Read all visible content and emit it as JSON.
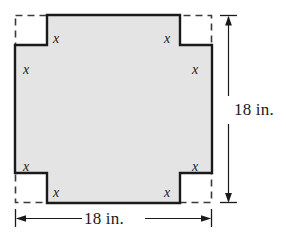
{
  "figure": {
    "shape_kind": "cross-shaped region",
    "fill_color": "#e4e4e4",
    "outline_color": "#1a1a1a",
    "dashed_color": "#3a3a3a",
    "background_color": "#ffffff",
    "outer_square": {
      "width_label": "18 in.",
      "height_label": "18 in.",
      "style": "dashed"
    },
    "dimensions": [
      {
        "id": "width",
        "label": "18 in.",
        "orientation": "horizontal"
      },
      {
        "id": "height",
        "label": "18 in.",
        "orientation": "vertical"
      }
    ],
    "corner_labels": [
      {
        "id": "top-left-horizontal",
        "text": "x",
        "x": 53,
        "y": 32
      },
      {
        "id": "top-left-vertical",
        "text": "x",
        "x": 23,
        "y": 63
      },
      {
        "id": "top-right-horizontal",
        "text": "x",
        "x": 164,
        "y": 32
      },
      {
        "id": "top-right-vertical",
        "text": "x",
        "x": 192,
        "y": 63
      },
      {
        "id": "bottom-left-vertical",
        "text": "x",
        "x": 23,
        "y": 160
      },
      {
        "id": "bottom-left-horizontal",
        "text": "x",
        "x": 53,
        "y": 186
      },
      {
        "id": "bottom-right-horizontal",
        "text": "x",
        "x": 164,
        "y": 186
      },
      {
        "id": "bottom-right-vertical",
        "text": "x",
        "x": 192,
        "y": 160
      }
    ],
    "geometry": {
      "square_left": 15,
      "square_top": 15,
      "square_right": 212,
      "square_bottom": 203,
      "notch_size_x": 32,
      "notch_size_y": 30,
      "cut_left": 47,
      "cut_right": 180,
      "cut_top": 45,
      "cut_bottom": 173,
      "vdim_x": 228,
      "hdim_y": 218
    }
  }
}
